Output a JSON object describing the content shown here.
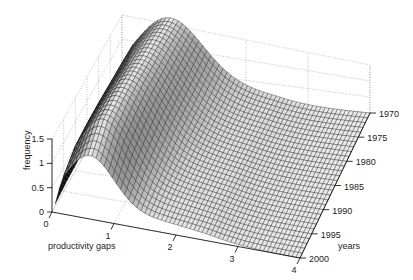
{
  "chart_data": {
    "type": "surface3d",
    "title": "",
    "xlabel": "productivity gaps",
    "ylabel": "years",
    "zlabel": "frequency",
    "x_ticks": [
      "0",
      "1",
      "2",
      "3",
      "4"
    ],
    "y_ticks": [
      "1970",
      "1975",
      "1980",
      "1985",
      "1990",
      "1995",
      "2000"
    ],
    "z_ticks": [
      "0",
      "0.5",
      "1",
      "1.5"
    ],
    "xlim": [
      0,
      4
    ],
    "ylim": [
      1970,
      2000
    ],
    "zlim": [
      0,
      1.5
    ],
    "grid": true,
    "mesh_color": "#000000",
    "face_color": "#ffffff",
    "surface_description": "Kernel density of productivity gaps by year; single peak near gap 0.7 with height about 1.5, decaying to near 0 by gap 4; peak narrows and sharpens in later years.",
    "series": [
      {
        "name": "1970",
        "peak_x": 0.75,
        "peak_z": 1.45,
        "width": 0.55
      },
      {
        "name": "1975",
        "peak_x": 0.72,
        "peak_z": 1.5,
        "width": 0.52
      },
      {
        "name": "1980",
        "peak_x": 0.7,
        "peak_z": 1.52,
        "width": 0.5
      },
      {
        "name": "1985",
        "peak_x": 0.68,
        "peak_z": 1.55,
        "width": 0.48
      },
      {
        "name": "1990",
        "peak_x": 0.65,
        "peak_z": 1.55,
        "width": 0.45
      },
      {
        "name": "1995",
        "peak_x": 0.62,
        "peak_z": 1.5,
        "width": 0.42
      },
      {
        "name": "2000",
        "peak_x": 0.6,
        "peak_z": 1.2,
        "width": 0.4
      }
    ]
  }
}
